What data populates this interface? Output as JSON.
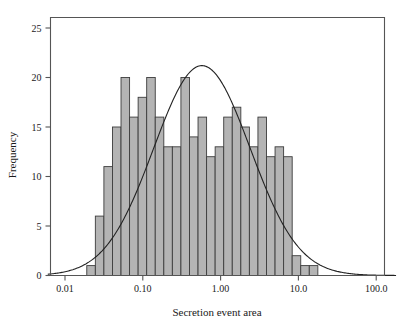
{
  "chart_data": {
    "type": "bar",
    "title": "",
    "subtitle": "",
    "xlabel": "Secretion event area",
    "ylabel": "Frequency",
    "x_scale": "log",
    "xlim": [
      0.006,
      180
    ],
    "ylim": [
      0,
      26.5
    ],
    "grid": false,
    "legend": null,
    "x_tick_labels": [
      "0.01",
      "0.10",
      "1.00",
      "10.0",
      "100.0"
    ],
    "x_tick_values": [
      0.01,
      0.1,
      1.0,
      10.0,
      100.0
    ],
    "y_tick_labels": [
      "0",
      "5",
      "10",
      "15",
      "20",
      "25"
    ],
    "y_tick_values": [
      0,
      5,
      10,
      15,
      20,
      25
    ],
    "bar_edges_log10": [
      -1.72,
      -1.61,
      -1.5,
      -1.39,
      -1.28,
      -1.17,
      -1.06,
      -0.95,
      -0.84,
      -0.73,
      -0.62,
      -0.51,
      -0.4,
      -0.29,
      -0.18,
      -0.07,
      0.04,
      0.15,
      0.26,
      0.37,
      0.48,
      0.59,
      0.7,
      0.81,
      0.92,
      1.03,
      1.14,
      1.25
    ],
    "categories": [
      "0.019-0.025",
      "0.025-0.032",
      "0.032-0.041",
      "0.041-0.053",
      "0.053-0.068",
      "0.068-0.087",
      "0.087-0.112",
      "0.112-0.144",
      "0.144-0.186",
      "0.186-0.239",
      "0.239-0.309",
      "0.309-0.398",
      "0.398-0.513",
      "0.513-0.661",
      "0.661-0.851",
      "0.851-1.096",
      "1.096-1.413",
      "1.413-1.820",
      "1.820-2.344",
      "2.344-3.020",
      "3.020-3.890",
      "3.890-5.012",
      "5.012-6.457",
      "6.457-8.318",
      "8.318-10.72",
      "10.72-13.80",
      "13.80-17.78"
    ],
    "values": [
      1,
      6,
      11,
      15,
      20,
      16,
      18,
      20,
      16,
      13,
      13,
      20,
      14,
      16,
      12,
      13,
      16,
      17,
      15,
      13,
      16,
      12,
      13,
      12,
      2,
      1,
      1
    ],
    "overlay_curve": {
      "name": "normal-fit",
      "description": "lognormal fit curve overlaid on histogram",
      "peak_x": 0.575,
      "peak_y": 21.2,
      "mu_log10": -0.24,
      "sigma_log10": 0.62,
      "amplitude": 21.2
    },
    "colors": {
      "bar_fill": "#b4b4b4",
      "bar_stroke": "#3c3c3c",
      "curve": "#222222",
      "axis": "#555555",
      "text": "#1a1a1a",
      "background": "#ffffff"
    }
  },
  "axes": {
    "x_title": "Secretion event area",
    "y_title": "Frequency"
  }
}
